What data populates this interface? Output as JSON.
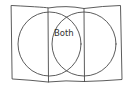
{
  "diagram": {
    "type": "venn",
    "style": "hand-drawn",
    "stroke_color": "#4a4a4a",
    "background": "#ffffff",
    "regions": {
      "overlap_label": "Both"
    },
    "frame": {
      "columns": 3
    }
  }
}
